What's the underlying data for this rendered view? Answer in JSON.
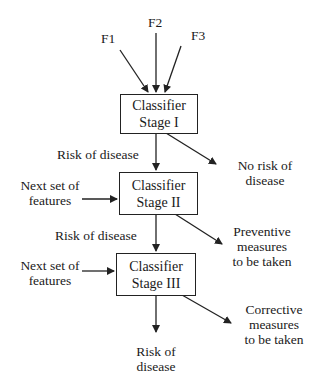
{
  "inputs": {
    "f1": "F1",
    "f2": "F2",
    "f3": "F3"
  },
  "stages": [
    {
      "line1": "Classifier",
      "line2": "Stage I"
    },
    {
      "line1": "Classifier",
      "line2": "Stage II"
    },
    {
      "line1": "Classifier",
      "line2": "Stage III"
    }
  ],
  "side_inputs": [
    {
      "line1": "Next set of",
      "line2": "features"
    },
    {
      "line1": "Next set of",
      "line2": "features"
    }
  ],
  "flow_labels": [
    "Risk of disease",
    "Risk of disease"
  ],
  "outputs": [
    {
      "line1": "No risk of",
      "line2": "disease"
    },
    {
      "line1": "Preventive",
      "line2": "measures",
      "line3": "to be taken"
    },
    {
      "line1": "Corrective",
      "line2": "measures",
      "line3": "to be taken"
    }
  ],
  "final_output": {
    "line1": "Risk of",
    "line2": "disease"
  },
  "colors": {
    "line": "#222222",
    "background": "#ffffff"
  }
}
